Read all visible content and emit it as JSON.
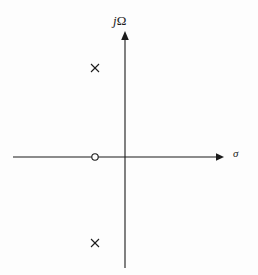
{
  "figure": {
    "background_color": "#fdfdfd",
    "stroke_color": "#1b1b1b",
    "width": 258,
    "height": 275
  },
  "axes": {
    "imaginary": {
      "label": "jΩ",
      "label_italic_part": "j",
      "label_upright_part": "Ω",
      "orientation": "vertical",
      "arrow": "up"
    },
    "real": {
      "label": "σ",
      "orientation": "horizontal",
      "arrow": "right"
    },
    "origin": {
      "x": 125,
      "y": 157
    }
  },
  "chart_data": {
    "type": "scatter",
    "title": "",
    "subtitle": "",
    "xlabel": "σ",
    "ylabel": "jΩ",
    "grid": false,
    "legend": false,
    "axis_style": "arrows-through-origin",
    "xlim": [
      -2.5,
      1.6
    ],
    "ylim": [
      -2.4,
      2.4
    ],
    "series": [
      {
        "name": "poles",
        "marker": "x",
        "marker_label": "×",
        "color": "#1b1b1b",
        "points": [
          {
            "x": -0.65,
            "y": 1.15,
            "px": 95,
            "py": 68
          },
          {
            "x": -0.65,
            "y": -1.15,
            "px": 95,
            "py": 243
          }
        ]
      },
      {
        "name": "zeros",
        "marker": "o",
        "marker_label": "○",
        "color": "#1b1b1b",
        "points": [
          {
            "x": -0.65,
            "y": 0,
            "px": 95,
            "py": 157
          }
        ]
      }
    ],
    "annotations": []
  }
}
